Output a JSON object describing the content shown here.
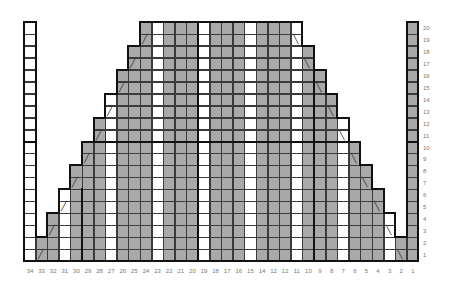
{
  "chart_data": {
    "type": "knitting-chart",
    "columns": 34,
    "rows": 20,
    "column_labels": [
      "34",
      "33",
      "32",
      "31",
      "30",
      "29",
      "28",
      "27",
      "26",
      "25",
      "24",
      "23",
      "22",
      "21",
      "20",
      "19",
      "18",
      "17",
      "16",
      "15",
      "14",
      "12",
      "12",
      "11",
      "10",
      "9",
      "8",
      "7",
      "6",
      "5",
      "4",
      "3",
      "2",
      "1"
    ],
    "row_labels": [
      "1",
      "2",
      "3",
      "4",
      "5",
      "6",
      "7",
      "8",
      "9",
      "10",
      "11",
      "12",
      "13",
      "14",
      "15",
      "16",
      "17",
      "18",
      "19",
      "20"
    ],
    "column_heights": {
      "34": 20,
      "33": 2,
      "32": 4,
      "31": 6,
      "30": 8,
      "29": 10,
      "28": 12,
      "27": 14,
      "26": 16,
      "25": 18,
      "24": 20,
      "23": 20,
      "22": 20,
      "21": 20,
      "20": 20,
      "19": 20,
      "18": 20,
      "17": 20,
      "16": 20,
      "15": 20,
      "14": 20,
      "13": 20,
      "12": 20,
      "11": 20,
      "10": 18,
      "9": 16,
      "8": 14,
      "7": 12,
      "6": 10,
      "5": 8,
      "4": 6,
      "3": 4,
      "2": 2,
      "1": 20
    },
    "white_columns": [
      34,
      31,
      27,
      23,
      19,
      15,
      11,
      7,
      3
    ],
    "decrease_marks": {
      "left_slant": [
        [
          33,
          1
        ],
        [
          32,
          3
        ],
        [
          31,
          5
        ],
        [
          30,
          7
        ],
        [
          29,
          9
        ],
        [
          28,
          11
        ],
        [
          27,
          13
        ],
        [
          26,
          15
        ],
        [
          25,
          17
        ],
        [
          24,
          19
        ]
      ],
      "right_slant": [
        [
          2,
          1
        ],
        [
          3,
          3
        ],
        [
          4,
          5
        ],
        [
          5,
          7
        ],
        [
          6,
          9
        ],
        [
          7,
          11
        ],
        [
          8,
          13
        ],
        [
          9,
          15
        ],
        [
          10,
          17
        ],
        [
          11,
          19
        ]
      ]
    },
    "colors": {
      "main": "#a9a9a9",
      "contrast": "#ffffff",
      "grid": "#3a3a3a",
      "outline": "#111111"
    },
    "thick_vertical_after_columns": [
      30,
      20,
      10
    ],
    "thick_horizontal_after_row": 10
  }
}
